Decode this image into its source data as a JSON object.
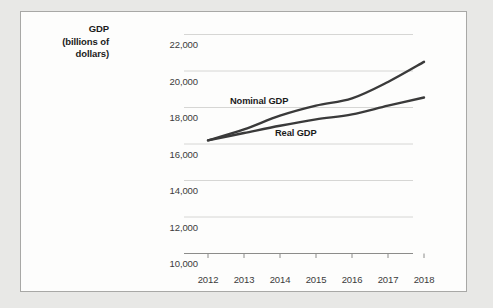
{
  "chart_data": {
    "type": "line",
    "title": "",
    "axis_title_lines": [
      "GDP",
      "(billions of",
      "dollars)"
    ],
    "ylabel": "GDP (billions of dollars)",
    "xlabel": "",
    "x": [
      2012,
      2013,
      2014,
      2015,
      2016,
      2017,
      2018
    ],
    "categories": [
      "2012",
      "2013",
      "2014",
      "2015",
      "2016",
      "2017",
      "2018"
    ],
    "ylim": [
      10000,
      22000
    ],
    "yticks": [
      10000,
      12000,
      14000,
      16000,
      18000,
      20000,
      22000
    ],
    "ytick_labels": [
      "10,000",
      "12,000",
      "14,000",
      "16,000",
      "18,000",
      "20,000",
      "22,000"
    ],
    "grid": true,
    "legend_position": "inline-annotations",
    "series": [
      {
        "name": "Nominal GDP",
        "label": "Nominal GDP",
        "color": "#3a3a3a",
        "values": [
          16200,
          16800,
          17550,
          18100,
          18500,
          19400,
          20500
        ]
      },
      {
        "name": "Real GDP",
        "label": "Real GDP",
        "color": "#3a3a3a",
        "values": [
          16200,
          16600,
          17000,
          17350,
          17620,
          18100,
          18550
        ]
      }
    ],
    "annotations": [
      {
        "text": "Nominal GDP",
        "x": 2014.05,
        "y": 18450
      },
      {
        "text": "Real GDP",
        "x": 2015.15,
        "y": 16950
      }
    ],
    "colors": {
      "page_background": "#e8e8e6",
      "panel_background": "#fdfdfc",
      "panel_border": "#a8a8a6",
      "gridline": "#d6d6d4",
      "axis_line": "#8c8c8a",
      "line_color": "#3a3a3a",
      "tick_text": "#3b3b3b",
      "title_text": "#1b1b1b"
    }
  }
}
